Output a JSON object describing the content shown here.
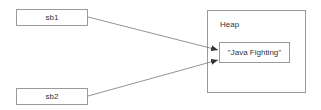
{
  "variables": [
    {
      "id": "sb1",
      "label": "sb1"
    },
    {
      "id": "sb2",
      "label": "sb2"
    }
  ],
  "heap": {
    "label": "Heap",
    "object": {
      "label": "\"Java Fighting\""
    }
  },
  "arrows": [
    {
      "from": "sb1",
      "to": "heap.object"
    },
    {
      "from": "sb2",
      "to": "heap.object"
    }
  ],
  "colors": {
    "stroke": "#9a9a9a",
    "line": "#777777",
    "text": "#333333"
  }
}
